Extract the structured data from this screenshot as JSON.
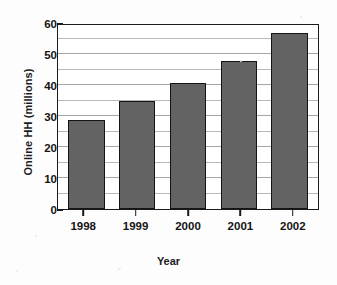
{
  "chart_data": {
    "type": "bar",
    "title": "",
    "xlabel": "Year",
    "ylabel": "Online HH (millions)",
    "categories": [
      "1998",
      "1999",
      "2000",
      "2001",
      "2002"
    ],
    "values": [
      28.7,
      35.0,
      40.8,
      47.6,
      56.8
    ],
    "series": [
      {
        "name": "Online HH (millions)",
        "values": [
          28.7,
          35.0,
          40.8,
          47.6,
          56.8
        ]
      }
    ],
    "ylim": [
      0,
      60
    ],
    "xlim_categories": 5,
    "y_major_ticks": [
      0,
      10,
      20,
      30,
      40,
      50,
      60
    ],
    "y_major_tick_labels": [
      "0",
      "10",
      "20",
      "30",
      "40",
      "50",
      "60"
    ],
    "y_minor_ticks": [
      5,
      15,
      25,
      35,
      45,
      55
    ],
    "grid": "horizontal-minor-and-major",
    "legend": "none",
    "bar_color": "#636363",
    "bar_border_color": "#141414",
    "axis_color": "#1a1a1a",
    "gridline_color": "#b9b9b9",
    "background_color": "#fdfdfd",
    "plot_background_color": "#ffffff"
  },
  "figure": {
    "axis_title_x": "Year",
    "axis_title_y": "Online HH (millions)"
  }
}
